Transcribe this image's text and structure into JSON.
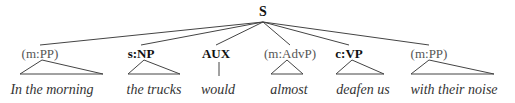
{
  "diagram": {
    "type": "syntax-tree",
    "root": {
      "label": "S",
      "x": 263,
      "y": 4
    },
    "line_color": "#444444",
    "constituents": [
      {
        "label": "(m:PP)",
        "bold": false,
        "x": 40,
        "shape": "triangle",
        "tri": [
          20,
          103,
          42
        ],
        "word": "In the morning",
        "word_x": 52
      },
      {
        "label": "s:NP",
        "bold": true,
        "x": 141,
        "shape": "triangle",
        "tri": [
          128,
          180,
          144
        ],
        "word": "the trucks",
        "word_x": 154
      },
      {
        "label": "AUX",
        "bold": true,
        "x": 216,
        "shape": "line",
        "tri": [
          219,
          219,
          219
        ],
        "word": "would",
        "word_x": 218
      },
      {
        "label": "(m:AdvP)",
        "bold": false,
        "x": 290,
        "shape": "triangle",
        "tri": [
          271,
          303,
          287
        ],
        "word": "almost",
        "word_x": 289
      },
      {
        "label": "c:VP",
        "bold": true,
        "x": 349,
        "shape": "triangle",
        "tri": [
          336,
          384,
          352
        ],
        "word": "deafen us",
        "word_x": 363
      },
      {
        "label": "(m:PP)",
        "bold": false,
        "x": 429,
        "shape": "triangle",
        "tri": [
          411,
          494,
          429
        ],
        "word": "with their noise",
        "word_x": 454
      }
    ]
  }
}
